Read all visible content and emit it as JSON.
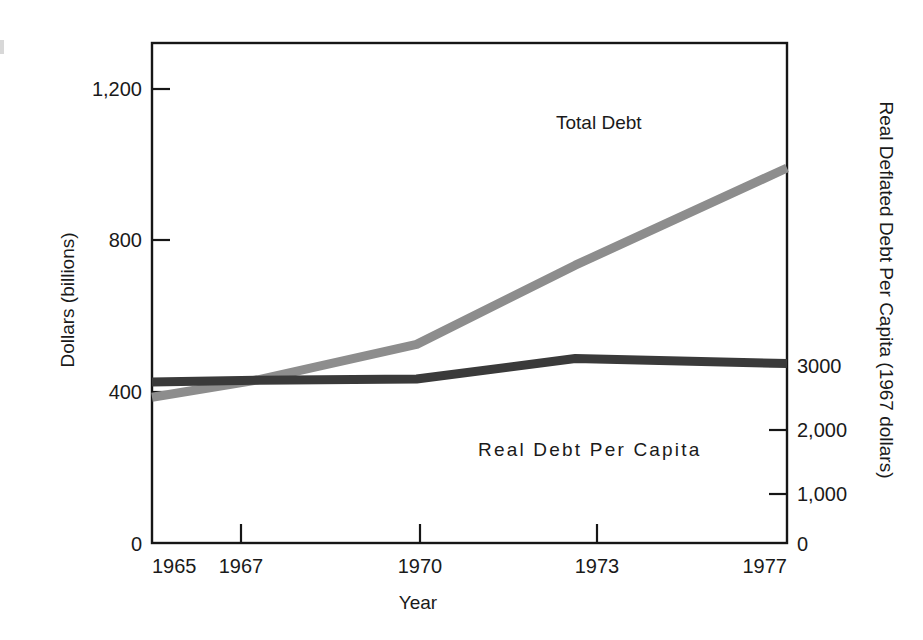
{
  "chart_data": {
    "type": "line",
    "title": "",
    "xlabel": "Year",
    "ylabel": "Dollars (billions)",
    "y2label": "Real Deflated Debt Per Capita (1967 dollars)",
    "x": [
      1965,
      1967,
      1970,
      1973,
      1977
    ],
    "xticklabels": [
      "1965",
      "1967",
      "1970",
      "1973",
      "1977"
    ],
    "yticklabels": [
      "0",
      "400",
      "800",
      "1,200"
    ],
    "yticks": [
      0,
      400,
      800,
      1200
    ],
    "ylim": [
      0,
      1440
    ],
    "y2ticklabels": [
      "0",
      "1,000",
      "2,000",
      "3000"
    ],
    "y2ticks": [
      0,
      1000,
      2000,
      3000
    ],
    "y2lim": [
      0,
      8050
    ],
    "grid": false,
    "legend_position": "inline-annotations",
    "series": [
      {
        "name": "Total Debt",
        "axis": "left",
        "color": "#8d8d8d",
        "values": [
          420,
          470,
          572,
          800,
          1080
        ],
        "label_x": 1972.1,
        "label_y": 1230
      },
      {
        "name": "Real Debt Per Capita",
        "axis": "right",
        "color": "#3a3a3a",
        "values": [
          2590,
          2620,
          2640,
          2970,
          2890
        ],
        "label_x": 1971.5,
        "label_y": 1540
      }
    ]
  },
  "axes": {
    "x_title": "Year",
    "y_left_title": "Dollars (billions)",
    "y_right_title": "Real Deflated Debt Per Capita (1967 dollars)",
    "x_ticks": [
      "1965",
      "1967",
      "1970",
      "1973",
      "1977"
    ],
    "y_left_ticks": [
      "1,200",
      "800",
      "400",
      "0"
    ],
    "y_right_ticks": [
      "3000",
      "2,000",
      "1,000",
      "0"
    ]
  },
  "annotations": {
    "total_debt": "Total Debt",
    "real_debt": "Real Debt Per Capita"
  }
}
